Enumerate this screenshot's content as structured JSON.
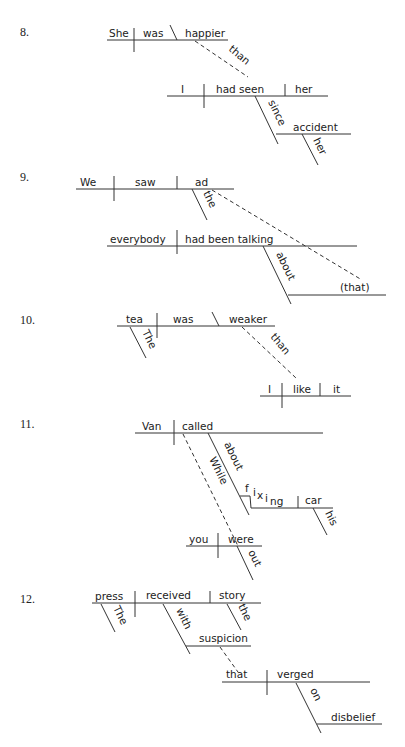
{
  "diagrams": [
    {
      "number": "8.",
      "words": {
        "subject": "She",
        "verb": "was",
        "complement": "happier",
        "conj": "than",
        "sub_subject": "I",
        "sub_verb": "had seen",
        "sub_object": "her",
        "prep": "since",
        "prep_object": "accident",
        "modifier": "her"
      }
    },
    {
      "number": "9.",
      "words": {
        "subject": "We",
        "verb": "saw",
        "object": "ad",
        "article": "the",
        "sub_subject": "everybody",
        "sub_verb": "had been talking",
        "prep": "about",
        "prep_object": "(that)"
      }
    },
    {
      "number": "10.",
      "words": {
        "subject": "tea",
        "verb": "was",
        "complement": "weaker",
        "article": "The",
        "conj": "than",
        "sub_subject": "I",
        "sub_verb": "like",
        "sub_object": "it"
      }
    },
    {
      "number": "11.",
      "words": {
        "subject": "Van",
        "verb": "called",
        "prep": "about",
        "gerund_f": "f",
        "gerund_i": "i",
        "gerund_x": "x",
        "gerund_i2": "i",
        "gerund_ng": "ng",
        "gerund_object": "car",
        "modifier": "his",
        "conj": "While",
        "sub_subject": "you",
        "sub_verb": "were",
        "adverb": "out"
      }
    },
    {
      "number": "12.",
      "words": {
        "subject": "press",
        "verb": "received",
        "object": "story",
        "article": "The",
        "object_article": "the",
        "prep": "with",
        "prep_object": "suspicion",
        "rel_subject": "that",
        "rel_verb": "verged",
        "rel_prep": "on",
        "rel_prep_object": "disbelief"
      }
    }
  ]
}
